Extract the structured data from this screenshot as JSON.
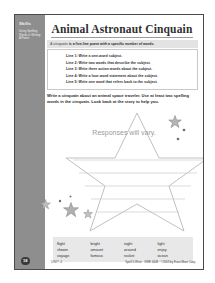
{
  "sidebar": {
    "title": "Skills",
    "description": "Using Spelling Words in Writing: A Poem"
  },
  "header": {
    "title": "Animal Astronaut Cinquain"
  },
  "definition": {
    "term": "A cinquain",
    "text": " is a five-line poem with a specific number of words."
  },
  "lines": [
    "Line 1: Write a one-word subject.",
    "Line 2: Write two words that describe the subject.",
    "Line 3: Write three action words about the subject.",
    "Line 4: Write a four-word statement about the subject.",
    "Line 5: Write one word that refers back to the subject."
  ],
  "directions": {
    "text": "Write a cinquain about an animal space traveler. Use at least two spelling words in the cinquain. Look back at the story to help you."
  },
  "answer": {
    "placeholder": "Responses will vary."
  },
  "wordbank": {
    "words": [
      "flight",
      "bright",
      "night",
      "light",
      "shown",
      "amount",
      "around",
      "enjoy",
      "voyage",
      "famous",
      "rocket",
      "ocean"
    ]
  },
  "footer": {
    "page_number": "18",
    "unit": "UNIT 4",
    "copyright": "Spell It-Write · SWE 4448 · ©2003 by Evan-Moor Corp."
  },
  "colors": {
    "sidebar": "#8e8e8e",
    "definition_bar": "#e3e3e3",
    "wordbank": "#e8e8e8",
    "placeholder_text": "#9a9a9a",
    "page_border": "#4a4a4a"
  }
}
